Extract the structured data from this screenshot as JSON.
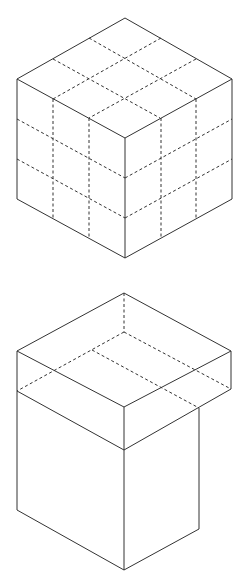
{
  "figures": [
    {
      "name": "cube-3x3x3",
      "description": "Isometric cube divided into 3x3x3 subcubes by dashed lines",
      "vertices": {
        "top": [
          125,
          18
        ],
        "left": [
          17,
          79
        ],
        "right": [
          232,
          79
        ],
        "front": [
          125,
          138
        ],
        "bottom_left": [
          17,
          199
        ],
        "bottom": [
          125,
          258
        ],
        "bottom_right": [
          232,
          199
        ]
      },
      "divisions": 3
    },
    {
      "name": "box-with-overhanging-lid",
      "description": "Rectangular prism body with a wider slab lid overhanging to the right and back",
      "lid": {
        "top": [
          124,
          293
        ],
        "left": [
          17,
          351
        ],
        "right": [
          231,
          351
        ],
        "front": [
          124,
          407
        ],
        "left_bottom": [
          17,
          391
        ],
        "right_bottom": [
          231,
          389
        ],
        "front_bottom": [
          124,
          450
        ],
        "hidden_back_bottom": [
          124,
          332
        ]
      },
      "body": {
        "right_top": [
          199,
          408
        ],
        "left_bottom": [
          17,
          510
        ],
        "front_bottom": [
          124,
          570
        ],
        "right_bottom": [
          199,
          529
        ],
        "hidden_back_top_left": [
          92,
          350
        ]
      }
    }
  ],
  "colors": {
    "stroke": "#333333",
    "background": "#ffffff"
  }
}
